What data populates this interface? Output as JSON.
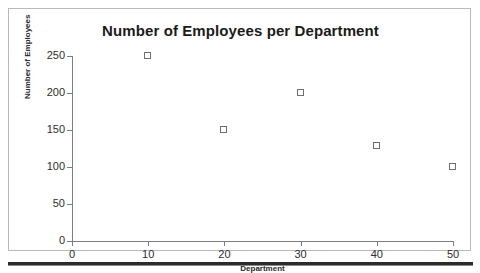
{
  "chart_data": {
    "type": "scatter",
    "title": "Number of Employees per Department",
    "xlabel": "Department",
    "ylabel": "Number of Employees",
    "xlim": [
      0,
      50
    ],
    "ylim": [
      0,
      250
    ],
    "xticks": [
      "0",
      "10",
      "20",
      "30",
      "40",
      "50"
    ],
    "yticks": [
      "0",
      "50",
      "100",
      "150",
      "200",
      "250"
    ],
    "grid": false,
    "legend": null,
    "marker_style": "open-square",
    "marker_color": "#6f6f6f",
    "x": [
      10,
      20,
      30,
      40,
      50
    ],
    "values": [
      250,
      150,
      200,
      128,
      100
    ],
    "points": [
      {
        "x": 10,
        "y": 250
      },
      {
        "x": 20,
        "y": 150
      },
      {
        "x": 30,
        "y": 200
      },
      {
        "x": 40,
        "y": 128
      },
      {
        "x": 50,
        "y": 100
      }
    ]
  },
  "figure": {
    "border_color": "#b9b9b9",
    "axis_color": "#7d7d7d",
    "text_color": "#2e2e2e",
    "background": "#ffffff"
  }
}
